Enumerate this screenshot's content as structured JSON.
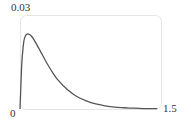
{
  "chart_data": {
    "type": "line",
    "title": "",
    "xlabel": "",
    "ylabel": "",
    "xlim": [
      0,
      1.5
    ],
    "ylim": [
      0,
      0.03
    ],
    "grid": false,
    "legend": null,
    "tick_labels": {
      "y_max": "0.03",
      "x_min": "0",
      "x_max": "1.5"
    },
    "series": [
      {
        "name": "density",
        "color": "#555555",
        "x": [
          0.0,
          0.01,
          0.02,
          0.04,
          0.06,
          0.08,
          0.1,
          0.12,
          0.15,
          0.2,
          0.25,
          0.3,
          0.35,
          0.4,
          0.5,
          0.6,
          0.7,
          0.8,
          0.9,
          1.0,
          1.1,
          1.2,
          1.3,
          1.4,
          1.45
        ],
        "y": [
          0.0,
          0.008,
          0.015,
          0.0215,
          0.0235,
          0.024,
          0.0238,
          0.0233,
          0.022,
          0.0193,
          0.0165,
          0.0138,
          0.0114,
          0.0093,
          0.0062,
          0.004,
          0.0026,
          0.0016,
          0.001,
          0.0006,
          0.0004,
          0.00025,
          0.00015,
          0.0001,
          0.0001
        ]
      }
    ]
  }
}
